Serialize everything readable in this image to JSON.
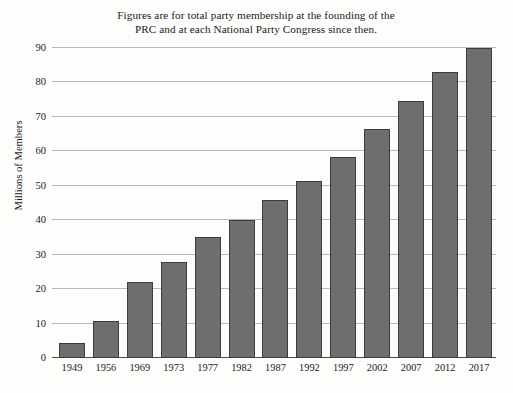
{
  "chart_data": {
    "type": "bar",
    "title": "Figures are for total party membership at the founding of the PRC and at each National Party Congress since then.",
    "title_lines": [
      "Figures are for total party membership at the founding of the",
      "PRC and at each National Party Congress since then."
    ],
    "xlabel": "",
    "ylabel": "Millions of Members",
    "categories": [
      "1949",
      "1956",
      "1969",
      "1973",
      "1977",
      "1982",
      "1987",
      "1992",
      "1997",
      "2002",
      "2007",
      "2012",
      "2017"
    ],
    "values": [
      4.5,
      10.8,
      22,
      28,
      35,
      40,
      46,
      51.5,
      58.5,
      66.4,
      74.5,
      83,
      89.9
    ],
    "ylim": [
      0,
      90
    ],
    "yticks": [
      0,
      10,
      20,
      30,
      40,
      50,
      60,
      70,
      80,
      90
    ],
    "ytick_labels": [
      "0",
      "10",
      "20",
      "30",
      "40",
      "50",
      "60",
      "70",
      "80",
      "90"
    ],
    "grid": true,
    "legend": false,
    "legend_position": "none",
    "bar_color": "#6e6e6e",
    "bar_border_color": "#3d3d3d",
    "gridline_color": "#b9b9b9",
    "axis_color": "#4a4a4a",
    "background_color": "#fdfdfb"
  }
}
